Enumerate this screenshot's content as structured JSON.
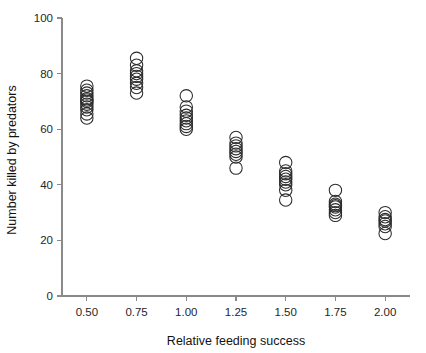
{
  "chart_data": {
    "type": "scatter",
    "title": "",
    "xlabel": "Relative feeding success",
    "ylabel": "Number killed by predators",
    "xlim": [
      0.375,
      2.125
    ],
    "ylim": [
      0,
      100
    ],
    "xticks": [
      0.5,
      0.75,
      1.0,
      1.25,
      1.5,
      1.75,
      2.0
    ],
    "xticklabels": [
      "0.50",
      "0.75",
      "1.00",
      "1.25",
      "1.50",
      "1.75",
      "2.00"
    ],
    "yticks": [
      0,
      20,
      40,
      60,
      80,
      100
    ],
    "yticklabels": [
      "0",
      "20",
      "40",
      "60",
      "80",
      "100"
    ],
    "grid": false,
    "legend": null,
    "marker": {
      "shape": "open-circle",
      "radius_px": 6.2,
      "edge_color": "#2b2b2b",
      "fill": "none",
      "edge_width": 1.05
    },
    "categories": [
      0.5,
      0.75,
      1.0,
      1.25,
      1.5,
      1.75,
      2.0
    ],
    "series": [
      {
        "name": "Number killed by predators",
        "points": [
          {
            "x": 0.5,
            "values": [
              75.5,
              74.0,
              73.0,
              72.0,
              71.0,
              70.5,
              70.0,
              69.0,
              68.0,
              67.0,
              65.5,
              64.0
            ]
          },
          {
            "x": 0.75,
            "values": [
              85.5,
              83.0,
              81.0,
              80.0,
              79.0,
              78.0,
              76.5,
              75.0,
              73.0
            ]
          },
          {
            "x": 1.0,
            "values": [
              72.0,
              68.0,
              66.5,
              65.0,
              64.0,
              63.0,
              62.0,
              61.0,
              60.0
            ]
          },
          {
            "x": 1.25,
            "values": [
              57.0,
              55.0,
              54.0,
              53.0,
              52.0,
              51.0,
              50.0,
              46.0
            ]
          },
          {
            "x": 1.5,
            "values": [
              48.0,
              45.0,
              44.0,
              43.0,
              42.0,
              41.0,
              40.0,
              38.0,
              34.5
            ]
          },
          {
            "x": 1.75,
            "values": [
              38.0,
              34.0,
              33.0,
              32.5,
              32.0,
              31.0,
              30.0,
              29.0
            ]
          },
          {
            "x": 2.0,
            "values": [
              30.0,
              28.5,
              27.5,
              27.0,
              26.0,
              25.0,
              22.5
            ]
          }
        ]
      }
    ]
  }
}
